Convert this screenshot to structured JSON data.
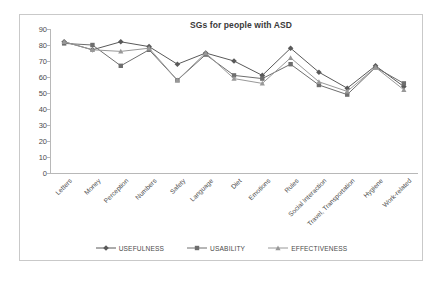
{
  "chart_data": {
    "type": "line",
    "title": "SGs for people with ASD",
    "xlabel": "",
    "ylabel": "",
    "ylim": [
      0,
      90
    ],
    "ytick_step": 10,
    "yticks": [
      90,
      80,
      70,
      60,
      50,
      40,
      30,
      20,
      10,
      0
    ],
    "grid": false,
    "legend_position": "bottom",
    "categories": [
      "Letters",
      "Money",
      "Perception",
      "Numbers",
      "Safety",
      "Language",
      "Diet",
      "Emotions",
      "Rules",
      "Social Interaction",
      "Travel, Transportation",
      "Hygiene",
      "Work-related"
    ],
    "series": [
      {
        "name": "USEFULNESS",
        "marker": "diamond",
        "color": "#595959",
        "values": [
          82,
          77,
          82,
          79,
          68,
          75,
          70,
          61,
          78,
          63,
          53,
          67,
          54
        ]
      },
      {
        "name": "USABILITY",
        "marker": "square",
        "color": "#6e6e6e",
        "values": [
          81,
          80,
          67,
          77,
          58,
          74,
          61,
          59,
          68,
          55,
          49,
          66,
          56
        ]
      },
      {
        "name": "EFFECTIVENESS",
        "marker": "triangle",
        "color": "#989898",
        "values": [
          82,
          77,
          76,
          78,
          58,
          75,
          59,
          56,
          72,
          57,
          51,
          66,
          52
        ]
      }
    ]
  },
  "legend": {
    "items": [
      {
        "label": "USEFULNESS"
      },
      {
        "label": "USABILITY"
      },
      {
        "label": "EFFECTIVENESS"
      }
    ]
  },
  "colors": {
    "frame_border": "#c9c9c9",
    "axis": "#b8b8b8",
    "text": "#4a4a4a",
    "title": "#3a3a3a",
    "background": "#ffffff"
  }
}
